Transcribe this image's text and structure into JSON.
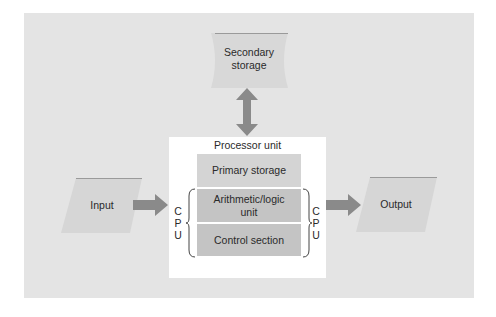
{
  "diagram": {
    "nodes": {
      "secondary_storage": "Secondary storage",
      "secondary_storage_line1": "Secondary",
      "secondary_storage_line2": "storage",
      "processor_unit": "Processor unit",
      "primary_storage": "Primary storage",
      "alu_line1": "Arithmetic/logic",
      "alu_line2": "unit",
      "control_section": "Control section",
      "input": "Input",
      "output": "Output"
    },
    "cpu_label": {
      "c": "C",
      "p": "P",
      "u": "U"
    },
    "edges": [
      {
        "from": "input",
        "to": "processor_unit",
        "type": "arrow"
      },
      {
        "from": "processor_unit",
        "to": "output",
        "type": "arrow"
      },
      {
        "from": "secondary_storage",
        "to": "processor_unit",
        "type": "bidirectional-arrow"
      }
    ],
    "groups": [
      {
        "name": "CPU",
        "members": [
          "alu",
          "control_section"
        ]
      }
    ],
    "colors": {
      "panel": "#e4e4e4",
      "shape": "#d6d6d6",
      "arrow": "#8a8a8a",
      "alu": "#c4c4c4",
      "primary": "#d4d4d4"
    }
  }
}
